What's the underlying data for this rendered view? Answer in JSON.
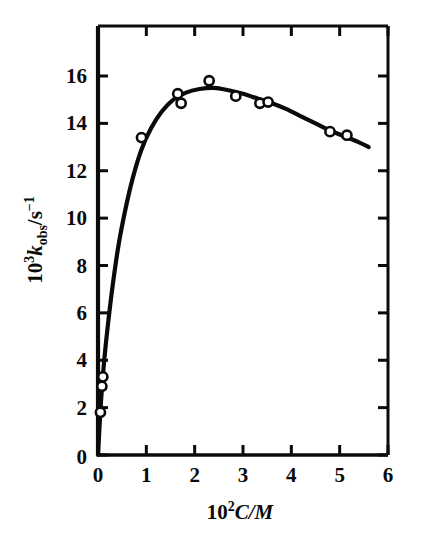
{
  "figure": {
    "background_color": "#ffffff",
    "ink_color": "#0a0a0a"
  },
  "chart_data": {
    "type": "scatter",
    "title": "",
    "subtitle": "",
    "xlabel": "10²C/M",
    "xlabel_parts": {
      "base": "10",
      "exponent": "2",
      "variable": "C/M"
    },
    "ylabel": "10³k_obs/s⁻¹",
    "ylabel_parts": {
      "base": "10",
      "exponent": "3",
      "variable": "k",
      "subscript": "obs",
      "units": "/s",
      "units_exponent": "−1"
    },
    "xlim": [
      0,
      6
    ],
    "ylim": [
      0,
      17
    ],
    "xticks": [
      0,
      1,
      2,
      3,
      4,
      5,
      6
    ],
    "xtick_labels": [
      "0",
      "1",
      "2",
      "3",
      "4",
      "5",
      "6"
    ],
    "yticks": [
      0,
      2,
      4,
      6,
      8,
      10,
      12,
      14,
      16
    ],
    "ytick_labels": [
      "0",
      "2",
      "4",
      "6",
      "8",
      "10",
      "12",
      "14",
      "16"
    ],
    "grid": false,
    "legend": null,
    "frame": "box-all-four-sides-with-inward-ticks",
    "marker_style": "open-circle",
    "points": [
      {
        "x": 0.05,
        "y": 1.8
      },
      {
        "x": 0.08,
        "y": 2.9
      },
      {
        "x": 0.1,
        "y": 3.3
      },
      {
        "x": 0.9,
        "y": 13.4
      },
      {
        "x": 1.65,
        "y": 15.25
      },
      {
        "x": 1.72,
        "y": 14.85
      },
      {
        "x": 2.3,
        "y": 15.8
      },
      {
        "x": 2.85,
        "y": 15.15
      },
      {
        "x": 3.35,
        "y": 14.85
      },
      {
        "x": 3.52,
        "y": 14.9
      },
      {
        "x": 4.8,
        "y": 13.65
      },
      {
        "x": 5.15,
        "y": 13.5
      }
    ],
    "fitted_curve": [
      {
        "x": 0.0,
        "y": 0.0
      },
      {
        "x": 0.06,
        "y": 2.2
      },
      {
        "x": 0.12,
        "y": 3.8
      },
      {
        "x": 0.2,
        "y": 5.4
      },
      {
        "x": 0.3,
        "y": 7.1
      },
      {
        "x": 0.42,
        "y": 8.8
      },
      {
        "x": 0.56,
        "y": 10.3
      },
      {
        "x": 0.72,
        "y": 11.7
      },
      {
        "x": 0.9,
        "y": 12.9
      },
      {
        "x": 1.1,
        "y": 13.8
      },
      {
        "x": 1.32,
        "y": 14.5
      },
      {
        "x": 1.56,
        "y": 15.0
      },
      {
        "x": 1.82,
        "y": 15.3
      },
      {
        "x": 2.1,
        "y": 15.45
      },
      {
        "x": 2.4,
        "y": 15.5
      },
      {
        "x": 2.7,
        "y": 15.4
      },
      {
        "x": 3.0,
        "y": 15.25
      },
      {
        "x": 3.3,
        "y": 15.05
      },
      {
        "x": 3.6,
        "y": 14.85
      },
      {
        "x": 3.9,
        "y": 14.6
      },
      {
        "x": 4.2,
        "y": 14.3
      },
      {
        "x": 4.5,
        "y": 14.0
      },
      {
        "x": 4.8,
        "y": 13.7
      },
      {
        "x": 5.1,
        "y": 13.45
      },
      {
        "x": 5.4,
        "y": 13.2
      },
      {
        "x": 5.6,
        "y": 13.0
      }
    ]
  }
}
